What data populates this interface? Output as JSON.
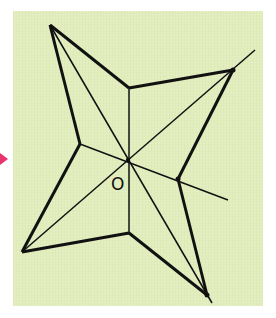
{
  "figure": {
    "background_color": "#e2edbd",
    "stroke_color": "#111111",
    "marker_color": "#e8336b",
    "center_label": "O",
    "center": [
      128,
      160
    ],
    "outer_vertices": {
      "top_left": [
        50,
        25
      ],
      "upper_right": [
        233,
        70
      ],
      "lower_right": [
        207,
        295
      ],
      "lower_left": [
        22,
        252
      ]
    },
    "inner_vertices": {
      "top": [
        129,
        88
      ],
      "right": [
        178,
        179
      ],
      "bottom": [
        129,
        233
      ],
      "left": [
        80,
        144
      ]
    },
    "extended_lines": {
      "upper_right_extension": [
        255,
        50
      ],
      "right_inner_extension": [
        228,
        200
      ],
      "lower_right_extension": [
        212,
        303
      ]
    }
  }
}
